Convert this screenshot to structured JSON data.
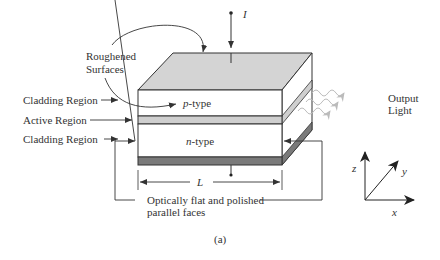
{
  "figure": {
    "caption": "(a)",
    "current_label": "I",
    "top_annotation": {
      "line1": "Roughened",
      "line2": "Surfaces"
    },
    "left_labels": {
      "cladding_top": "Cladding Region",
      "active": "Active Region",
      "cladding_bottom": "Cladding Region"
    },
    "layers": {
      "p_type": {
        "italic": "p",
        "rest": "-type"
      },
      "n_type": {
        "italic": "n",
        "rest": "-type"
      }
    },
    "length_label": "L",
    "bottom_annotation": {
      "line1": "Optically flat and polished",
      "line2": "parallel faces"
    },
    "output": {
      "line1": "Output",
      "line2": "Light"
    },
    "axes": {
      "z": "z",
      "y": "y",
      "x": "x"
    },
    "colors": {
      "top_surface": "#d4d4d4",
      "active_layer": "#cfcfcf",
      "contact": "#7a7a7a",
      "line": "#333333",
      "light_wave": "#bdbdbd"
    }
  }
}
